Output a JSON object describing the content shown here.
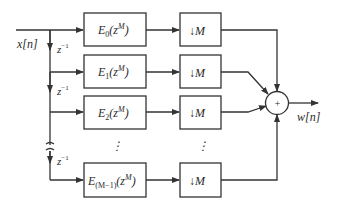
{
  "diagram": {
    "input_label": "x[n]",
    "output_label": "w[n]",
    "delay_label": "z",
    "delay_exp": "−1",
    "sum_symbol": "+",
    "ellipsis": "⋮",
    "branches": [
      {
        "filter_base": "E",
        "filter_sub": "0",
        "filter_arg": "(z",
        "filter_exp": "M",
        "filter_close": ")",
        "decimator": "↓M"
      },
      {
        "filter_base": "E",
        "filter_sub": "1",
        "filter_arg": "(z",
        "filter_exp": "M",
        "filter_close": ")",
        "decimator": "↓M"
      },
      {
        "filter_base": "E",
        "filter_sub": "2",
        "filter_arg": "(z",
        "filter_exp": "M",
        "filter_close": ")",
        "decimator": "↓M"
      },
      {
        "filter_base": "E",
        "filter_sub": "(M−1)",
        "filter_arg": "(z",
        "filter_exp": "M",
        "filter_close": ")",
        "decimator": "↓M"
      }
    ]
  }
}
